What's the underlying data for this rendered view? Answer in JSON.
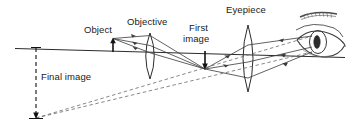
{
  "figure": {
    "background_color": "#ffffff",
    "ink_color": "#2b2b2b",
    "width": 361,
    "height": 132
  },
  "labels": {
    "object": "Object",
    "objective": "Objective",
    "first_image_line1": "First",
    "first_image_line2": "image",
    "eyepiece": "Eyepiece",
    "final_image": "Final image"
  },
  "components": {
    "optical_axis": {
      "name": "optical-axis",
      "x1": 15,
      "y1": 48,
      "x2": 345,
      "y2": 57
    },
    "object_arrow": {
      "name": "object-arrow",
      "x": 113,
      "base_y": 52,
      "tip_y": 39,
      "direction": "up"
    },
    "objective_lens": {
      "name": "objective-lens",
      "x": 150,
      "top_y": 33,
      "bottom_y": 79
    },
    "first_image_arrow": {
      "name": "first-image-arrow",
      "x": 205,
      "base_y": 52,
      "tip_y": 70,
      "direction": "down"
    },
    "eyepiece_lens": {
      "name": "eyepiece-lens",
      "x": 248,
      "top_y": 25,
      "bottom_y": 92
    },
    "eye": {
      "name": "eye-drawing",
      "x": 318,
      "y": 38
    },
    "final_image_arrow": {
      "name": "final-image-arrow",
      "x": 36,
      "top_y": 48,
      "bottom_y": 119,
      "style": "dashed",
      "direction": "down"
    }
  }
}
